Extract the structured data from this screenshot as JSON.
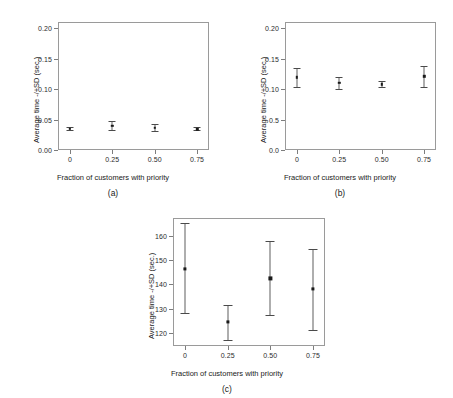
{
  "figure": {
    "panels": [
      {
        "caption": "(a)",
        "xlabel": "Fraction of customers with priority",
        "ylabel": "Average time -/+SD (sec.)",
        "yticks": [
          "0.00",
          "0.05",
          "0.10",
          "0.15",
          "0.20"
        ],
        "ytick_values": [
          0.0,
          0.05,
          0.1,
          0.15,
          0.2
        ],
        "xticks": [
          "0",
          "0.25",
          "0.50",
          "0.75"
        ],
        "xtick_values": [
          0,
          0.25,
          0.5,
          0.75
        ],
        "ylim": [
          0.0,
          0.21
        ],
        "xlim": [
          -0.07,
          0.82
        ],
        "points": [
          {
            "x": 0,
            "y": 0.035,
            "low": 0.033,
            "high": 0.038
          },
          {
            "x": 0.25,
            "y": 0.04,
            "low": 0.033,
            "high": 0.047
          },
          {
            "x": 0.5,
            "y": 0.036,
            "low": 0.031,
            "high": 0.042
          },
          {
            "x": 0.75,
            "y": 0.034,
            "low": 0.032,
            "high": 0.037
          }
        ]
      },
      {
        "caption": "(b)",
        "xlabel": "Fraction of customers with priority",
        "ylabel": "Average time -/+SD (sec.)",
        "yticks": [
          "0.0",
          "0.5",
          "0.10",
          "0.15",
          "0.20"
        ],
        "ytick_values": [
          0.0,
          0.05,
          0.1,
          0.15,
          0.2
        ],
        "xticks": [
          "0",
          "0.25",
          "0.50",
          "0.75"
        ],
        "xtick_values": [
          0,
          0.25,
          0.5,
          0.75
        ],
        "ylim": [
          0.0,
          0.21
        ],
        "xlim": [
          -0.07,
          0.82
        ],
        "points": [
          {
            "x": 0,
            "y": 0.119,
            "low": 0.103,
            "high": 0.134
          },
          {
            "x": 0.25,
            "y": 0.11,
            "low": 0.1,
            "high": 0.12
          },
          {
            "x": 0.5,
            "y": 0.108,
            "low": 0.103,
            "high": 0.114
          },
          {
            "x": 0.75,
            "y": 0.121,
            "low": 0.103,
            "high": 0.137
          }
        ]
      },
      {
        "caption": "(c)",
        "xlabel": "Fraction of customers with priority",
        "ylabel": "Average time -/+SD (sec.)",
        "yticks": [
          "120",
          "130",
          "140",
          "150",
          "160"
        ],
        "ytick_values": [
          120,
          130,
          140,
          150,
          160
        ],
        "xticks": [
          "0",
          "0.25",
          "0.50",
          "0.75"
        ],
        "xtick_values": [
          0,
          0.25,
          0.5,
          0.75
        ],
        "ylim": [
          114.5,
          167.5
        ],
        "xlim": [
          -0.07,
          0.82
        ],
        "points": [
          {
            "x": 0,
            "y": 146.5,
            "low": 128.0,
            "high": 165.5
          },
          {
            "x": 0.25,
            "y": 124.5,
            "low": 117.0,
            "high": 131.5
          },
          {
            "x": 0.5,
            "y": 142.5,
            "low": 127.5,
            "high": 158.0
          },
          {
            "x": 0.75,
            "y": 138.0,
            "low": 121.0,
            "high": 154.5
          }
        ]
      }
    ]
  },
  "chart_data": [
    {
      "type": "scatter",
      "panel": "(a)",
      "title": "",
      "xlabel": "Fraction of customers with priority",
      "ylabel": "Average time -/+SD (sec.)",
      "x": [
        0,
        0.25,
        0.5,
        0.75
      ],
      "xtick_labels": [
        "0",
        "0.25",
        "0.50",
        "0.75"
      ],
      "ytick_labels": [
        "0.00",
        "0.05",
        "0.10",
        "0.15",
        "0.20"
      ],
      "values": [
        0.035,
        0.04,
        0.036,
        0.034
      ],
      "error_low": [
        0.033,
        0.033,
        0.031,
        0.032
      ],
      "error_high": [
        0.038,
        0.047,
        0.042,
        0.037
      ],
      "ylim": [
        0.0,
        0.21
      ],
      "xlim": [
        -0.07,
        0.82
      ],
      "grid": false,
      "legend": "none"
    },
    {
      "type": "scatter",
      "panel": "(b)",
      "title": "",
      "xlabel": "Fraction of customers with priority",
      "ylabel": "Average time -/+SD (sec.)",
      "x": [
        0,
        0.25,
        0.5,
        0.75
      ],
      "xtick_labels": [
        "0",
        "0.25",
        "0.50",
        "0.75"
      ],
      "ytick_labels": [
        "0.0",
        "0.5",
        "0.10",
        "0.15",
        "0.20"
      ],
      "values": [
        0.119,
        0.11,
        0.108,
        0.121
      ],
      "error_low": [
        0.103,
        0.1,
        0.103,
        0.103
      ],
      "error_high": [
        0.134,
        0.12,
        0.114,
        0.137
      ],
      "ylim": [
        0.0,
        0.21
      ],
      "xlim": [
        -0.07,
        0.82
      ],
      "grid": false,
      "legend": "none"
    },
    {
      "type": "scatter",
      "panel": "(c)",
      "title": "",
      "xlabel": "Fraction of customers with priority",
      "ylabel": "Average time -/+SD (sec.)",
      "x": [
        0,
        0.25,
        0.5,
        0.75
      ],
      "xtick_labels": [
        "0",
        "0.25",
        "0.50",
        "0.75"
      ],
      "ytick_labels": [
        "120",
        "130",
        "140",
        "150",
        "160"
      ],
      "values": [
        146.5,
        124.5,
        142.5,
        138.0
      ],
      "error_low": [
        128.0,
        117.0,
        127.5,
        121.0
      ],
      "error_high": [
        165.5,
        131.5,
        158.0,
        154.5
      ],
      "ylim": [
        114.5,
        167.5
      ],
      "xlim": [
        -0.07,
        0.82
      ],
      "grid": false,
      "legend": "none"
    }
  ]
}
